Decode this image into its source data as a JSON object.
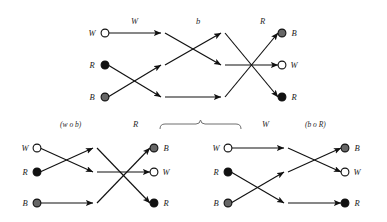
{
  "figure": {
    "colors": {
      "white_node_fill": "#ffffff",
      "black_node_fill": "#111111",
      "gray_node_fill": "#666666",
      "node_stroke": "#111111",
      "edge": "#111111",
      "brace": "#6f6f6f",
      "background": "#ffffff"
    }
  },
  "diagrams": [
    {
      "id": "top",
      "stage_labels": [
        "W",
        "b",
        "R"
      ],
      "left_nodes": [
        {
          "label": "W",
          "color": "white"
        },
        {
          "label": "R",
          "color": "black"
        },
        {
          "label": "B",
          "color": "gray"
        }
      ],
      "right_nodes": [
        {
          "label": "B",
          "color": "gray"
        },
        {
          "label": "W",
          "color": "white"
        },
        {
          "label": "R",
          "color": "black"
        }
      ]
    },
    {
      "id": "bottom-left",
      "stage_labels": [
        "(w o b)",
        "R"
      ],
      "left_nodes": [
        {
          "label": "W",
          "color": "white"
        },
        {
          "label": "R",
          "color": "black"
        },
        {
          "label": "B",
          "color": "gray"
        }
      ],
      "right_nodes": [
        {
          "label": "B",
          "color": "gray"
        },
        {
          "label": "W",
          "color": "white"
        },
        {
          "label": "R",
          "color": "black"
        }
      ]
    },
    {
      "id": "bottom-right",
      "stage_labels": [
        "W",
        "(b o R)"
      ],
      "left_nodes": [
        {
          "label": "W",
          "color": "white"
        },
        {
          "label": "R",
          "color": "black"
        },
        {
          "label": "B",
          "color": "gray"
        }
      ],
      "right_nodes": [
        {
          "label": "B",
          "color": "gray"
        },
        {
          "label": "W",
          "color": "white"
        },
        {
          "label": "R",
          "color": "black"
        }
      ]
    }
  ],
  "labels": {
    "top_stage_1": "W",
    "top_stage_2": "b",
    "top_stage_3": "R",
    "top_left_w": "W",
    "top_left_r": "R",
    "top_left_b": "B",
    "top_right_b": "B",
    "top_right_w": "W",
    "top_right_r": "R",
    "bl_stage_1": "(w o b)",
    "bl_stage_2": "R",
    "bl_left_w": "W",
    "bl_left_r": "R",
    "bl_left_b": "B",
    "bl_right_b": "B",
    "bl_right_w": "W",
    "bl_right_r": "R",
    "br_stage_1": "W",
    "br_stage_2": "(b o R)",
    "br_left_w": "W",
    "br_left_r": "R",
    "br_left_b": "B",
    "br_right_b": "B",
    "br_right_w": "W",
    "br_right_r": "R"
  }
}
